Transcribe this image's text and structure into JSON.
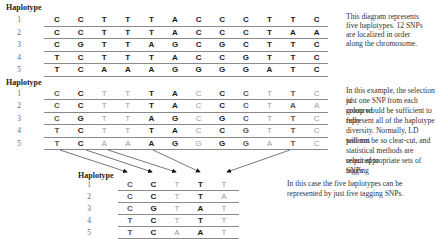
{
  "table1": {
    "header": "Haplotype",
    "row_labels": [
      "1",
      "2",
      "3",
      "4",
      "5"
    ],
    "rows": [
      [
        "C",
        "C",
        "T",
        "T",
        "T",
        "A",
        "C",
        "C",
        "C",
        "T",
        "T",
        "C"
      ],
      [
        "C",
        "C",
        "T",
        "T",
        "T",
        "A",
        "C",
        "C",
        "C",
        "T",
        "A",
        "A"
      ],
      [
        "C",
        "G",
        "T",
        "T",
        "A",
        "G",
        "C",
        "G",
        "C",
        "T",
        "T",
        "C"
      ],
      [
        "T",
        "C",
        "T",
        "T",
        "T",
        "A",
        "C",
        "C",
        "G",
        "T",
        "T",
        "C"
      ],
      [
        "T",
        "C",
        "A",
        "A",
        "A",
        "G",
        "G",
        "G",
        "G",
        "A",
        "T",
        "C"
      ]
    ]
  },
  "note1": {
    "lines": [
      "This diagram represents",
      "five haplotypes. 12 SNPs",
      "are localized in order",
      "along the chromosome."
    ]
  },
  "table2": {
    "header": "Haplotype",
    "row_labels": [
      "1",
      "2",
      "3",
      "4",
      "5"
    ],
    "column_emphasis": [
      "mid",
      "dark",
      "light",
      "light",
      "dark",
      "dark",
      "light",
      "dark",
      "mid",
      "light",
      "mid",
      "light"
    ],
    "rows": [
      [
        "C",
        "C",
        "T",
        "T",
        "T",
        "A",
        "C",
        "C",
        "C",
        "T",
        "T",
        "C"
      ],
      [
        "C",
        "C",
        "T",
        "T",
        "T",
        "A",
        "C",
        "C",
        "C",
        "T",
        "A",
        "A"
      ],
      [
        "C",
        "G",
        "T",
        "T",
        "A",
        "G",
        "C",
        "G",
        "C",
        "T",
        "T",
        "C"
      ],
      [
        "T",
        "C",
        "T",
        "T",
        "T",
        "A",
        "C",
        "C",
        "G",
        "T",
        "T",
        "C"
      ],
      [
        "T",
        "C",
        "A",
        "A",
        "A",
        "G",
        "G",
        "G",
        "G",
        "A",
        "T",
        "C"
      ]
    ]
  },
  "note2": {
    "lines": [
      "In this example, the selection of",
      "just one SNP from each coloured",
      "group would be sufficient to fully",
      "represent all of the haplotype",
      "diversity.  Normally, LD patterns",
      "will not be so clear-cut, and",
      "statistical methods are required to",
      "select appropriate sets of tagging",
      "SNPs"
    ]
  },
  "table3": {
    "header": "Haplotype",
    "row_labels": [
      "1",
      "2",
      "3",
      "4",
      "5"
    ],
    "column_emphasis": [
      "mid",
      "dark",
      "light",
      "dark",
      "light"
    ],
    "rows": [
      [
        "C",
        "C",
        "T",
        "T",
        "T"
      ],
      [
        "C",
        "C",
        "T",
        "T",
        "A"
      ],
      [
        "C",
        "G",
        "T",
        "A",
        "T"
      ],
      [
        "T",
        "C",
        "T",
        "T",
        "T"
      ],
      [
        "T",
        "C",
        "A",
        "A",
        "T"
      ]
    ]
  },
  "note3": {
    "lines": [
      "In this case the five haplotypes can be",
      "represented by just five tagging SNPs."
    ]
  },
  "arrows": [
    {
      "from": [
        60,
        150
      ],
      "to": [
        127,
        172
      ]
    },
    {
      "from": [
        86,
        150
      ],
      "to": [
        152,
        172
      ]
    },
    {
      "from": [
        108,
        150
      ],
      "to": [
        176,
        172
      ]
    },
    {
      "from": [
        153,
        150
      ],
      "to": [
        200,
        172
      ]
    },
    {
      "from": [
        290,
        150
      ],
      "to": [
        227,
        172
      ]
    }
  ]
}
